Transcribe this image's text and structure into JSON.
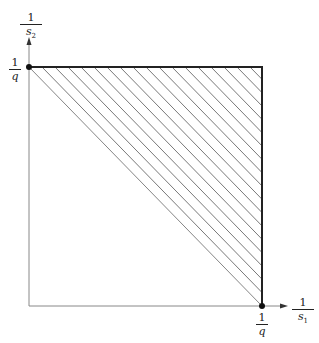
{
  "diagram": {
    "y_axis_label": {
      "num": "1",
      "den": "s",
      "sub": "2"
    },
    "x_axis_label": {
      "num": "1",
      "den": "s",
      "sub": "1"
    },
    "y_tick_label": {
      "num": "1",
      "den": "q"
    },
    "x_tick_label": {
      "num": "1",
      "den": "q"
    },
    "colors": {
      "axis": "#888888",
      "boundary": "#222222",
      "hatch": "#555555"
    }
  }
}
